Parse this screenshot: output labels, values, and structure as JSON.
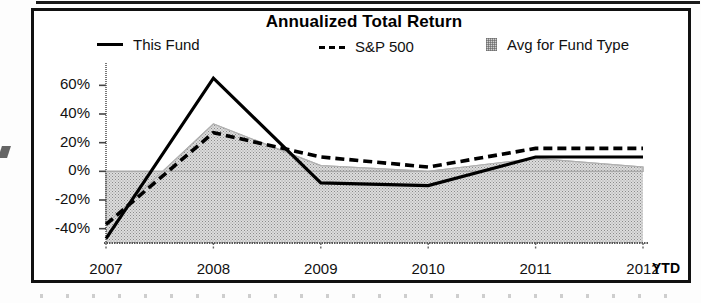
{
  "chart_data": {
    "type": "line",
    "title": "Annualized Total Return",
    "xlabel": "",
    "ylabel": "",
    "x": [
      "2007",
      "2008",
      "2009",
      "2010",
      "2011",
      "2012"
    ],
    "categories": [
      "2007",
      "2008",
      "2009",
      "2010",
      "2011",
      "2012"
    ],
    "x_axis_suffix": "YTD",
    "ylim": [
      -50,
      70
    ],
    "y_ticks": [
      60,
      40,
      20,
      0,
      -20,
      -40
    ],
    "y_tick_labels": [
      "60%",
      "40%",
      "20%",
      "0%",
      "-20%",
      "-40%"
    ],
    "grid": false,
    "legend_position": "top",
    "series": [
      {
        "name": "This Fund",
        "style": "solid-line",
        "color": "#000000",
        "values": [
          -47,
          65,
          -8,
          -10,
          10,
          10
        ]
      },
      {
        "name": "S&P 500",
        "style": "dashed-line",
        "color": "#000000",
        "values": [
          -37,
          27,
          10,
          3,
          16,
          16
        ]
      },
      {
        "name": "Avg for Fund Type",
        "style": "shaded-area",
        "color": "#d0d0d0",
        "values": [
          -37,
          33,
          4,
          0,
          9,
          3
        ]
      }
    ]
  },
  "chart": {
    "title": "Annualized Total Return",
    "ytd_label": "YTD",
    "legend": [
      {
        "label": "This Fund",
        "marker": "solid-line-swatch"
      },
      {
        "label": "S&P 500",
        "marker": "dashed-line-swatch"
      },
      {
        "label": "Avg for Fund Type",
        "marker": "shaded-area-swatch"
      }
    ],
    "y_tick_labels": [
      "60%",
      "40%",
      "20%",
      "0%",
      "-20%",
      "-40%"
    ],
    "x_tick_labels": [
      "2007",
      "2008",
      "2009",
      "2010",
      "2011",
      "2012"
    ]
  }
}
